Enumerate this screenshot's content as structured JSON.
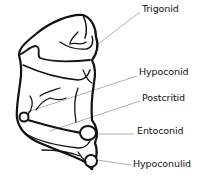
{
  "diagram": {
    "line_color": "#111111",
    "leader_color": "#9a9a9a",
    "labels": [
      {
        "id": "trigonid",
        "text": "Trigonid",
        "x": 142,
        "y": 3
      },
      {
        "id": "hypoconid",
        "text": "Hypoconid",
        "x": 139,
        "y": 66
      },
      {
        "id": "postcritid",
        "text": "Postcritid",
        "x": 142,
        "y": 92
      },
      {
        "id": "entoconid",
        "text": "Entoconid",
        "x": 137,
        "y": 125
      },
      {
        "id": "hypoconulid",
        "text": "Hypoconulid",
        "x": 133,
        "y": 158
      }
    ]
  }
}
